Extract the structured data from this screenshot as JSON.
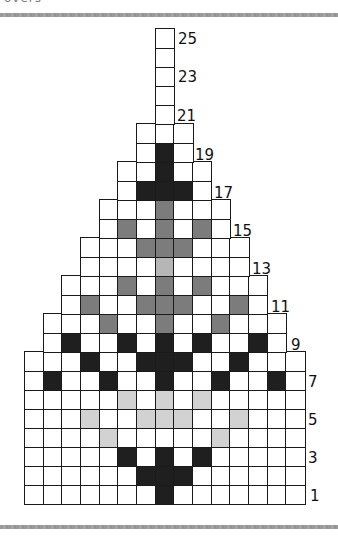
{
  "caption": "overs",
  "chart": {
    "type": "knitting-chart",
    "columns": 15,
    "rows": 25,
    "legend_colors": {
      "D": "#1f1f1f",
      "M": "#7c7c7c",
      "L": "#d2d2d2",
      "P": "#b6b6b6",
      "empty": "#ffffff"
    },
    "row_data": [
      {
        "row": 1,
        "span": [
          0,
          14
        ],
        "fills": {
          "7": "D"
        }
      },
      {
        "row": 2,
        "span": [
          0,
          14
        ],
        "fills": {
          "6": "D",
          "7": "D",
          "8": "D"
        }
      },
      {
        "row": 3,
        "span": [
          0,
          14
        ],
        "fills": {
          "5": "D",
          "7": "D",
          "9": "D"
        }
      },
      {
        "row": 4,
        "span": [
          0,
          14
        ],
        "fills": {
          "4": "L",
          "10": "L"
        }
      },
      {
        "row": 5,
        "span": [
          0,
          14
        ],
        "fills": {
          "3": "L",
          "6": "L",
          "7": "L",
          "8": "L",
          "11": "L"
        }
      },
      {
        "row": 6,
        "span": [
          0,
          14
        ],
        "fills": {
          "5": "L",
          "7": "L",
          "9": "L"
        }
      },
      {
        "row": 7,
        "span": [
          0,
          14
        ],
        "fills": {
          "1": "D",
          "4": "D",
          "7": "D",
          "10": "D",
          "13": "D"
        }
      },
      {
        "row": 8,
        "span": [
          0,
          14
        ],
        "fills": {
          "3": "D",
          "6": "D",
          "7": "D",
          "8": "D",
          "11": "D"
        }
      },
      {
        "row": 9,
        "span": [
          1,
          13
        ],
        "fills": {
          "2": "D",
          "5": "D",
          "7": "D",
          "9": "D",
          "12": "D"
        }
      },
      {
        "row": 10,
        "span": [
          1,
          13
        ],
        "fills": {
          "4": "M",
          "7": "M",
          "10": "M"
        }
      },
      {
        "row": 11,
        "span": [
          2,
          12
        ],
        "fills": {
          "3": "M",
          "6": "M",
          "7": "M",
          "8": "M",
          "11": "M"
        }
      },
      {
        "row": 12,
        "span": [
          2,
          12
        ],
        "fills": {
          "5": "M",
          "7": "M",
          "9": "M"
        }
      },
      {
        "row": 13,
        "span": [
          3,
          11
        ],
        "fills": {
          "7": "P"
        }
      },
      {
        "row": 14,
        "span": [
          3,
          11
        ],
        "fills": {
          "6": "M",
          "7": "M",
          "8": "M"
        }
      },
      {
        "row": 15,
        "span": [
          4,
          10
        ],
        "fills": {
          "5": "M",
          "7": "M",
          "9": "M"
        }
      },
      {
        "row": 16,
        "span": [
          4,
          10
        ],
        "fills": {
          "7": "M"
        }
      },
      {
        "row": 17,
        "span": [
          5,
          9
        ],
        "fills": {
          "6": "D",
          "7": "D",
          "8": "D"
        }
      },
      {
        "row": 18,
        "span": [
          5,
          9
        ],
        "fills": {
          "7": "D"
        }
      },
      {
        "row": 19,
        "span": [
          6,
          8
        ],
        "fills": {
          "7": "D"
        }
      },
      {
        "row": 20,
        "span": [
          6,
          8
        ],
        "fills": {}
      },
      {
        "row": 21,
        "span": [
          7,
          7
        ],
        "fills": {}
      },
      {
        "row": 22,
        "span": [
          7,
          7
        ],
        "fills": {}
      },
      {
        "row": 23,
        "span": [
          7,
          7
        ],
        "fills": {}
      },
      {
        "row": 24,
        "span": [
          7,
          7
        ],
        "fills": {}
      },
      {
        "row": 25,
        "span": [
          7,
          7
        ],
        "fills": {}
      }
    ],
    "row_labels": [
      {
        "text": "1",
        "x": 310,
        "y": 489
      },
      {
        "text": "3",
        "x": 308,
        "y": 451
      },
      {
        "text": "5",
        "x": 308,
        "y": 413
      },
      {
        "text": "7",
        "x": 308,
        "y": 375
      },
      {
        "text": "9",
        "x": 291,
        "y": 338
      },
      {
        "text": "11",
        "x": 271,
        "y": 300
      },
      {
        "text": "13",
        "x": 252,
        "y": 262
      },
      {
        "text": "15",
        "x": 233,
        "y": 224
      },
      {
        "text": "17",
        "x": 214,
        "y": 186
      },
      {
        "text": "19",
        "x": 195,
        "y": 148
      },
      {
        "text": "21",
        "x": 177,
        "y": 109
      },
      {
        "text": "23",
        "x": 178,
        "y": 70
      },
      {
        "text": "25",
        "x": 178,
        "y": 32
      }
    ]
  }
}
